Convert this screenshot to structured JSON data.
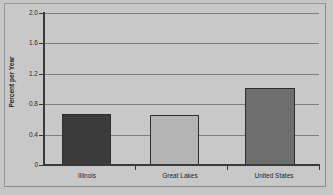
{
  "chart_data": {
    "type": "bar",
    "title": "",
    "xlabel": "",
    "ylabel": "Percent per Year",
    "categories": [
      "Illinois",
      "Great Lakes",
      "United States"
    ],
    "values": [
      0.67,
      0.66,
      1.01
    ],
    "series": [
      {
        "name": "Percent per Year",
        "values": [
          0.67,
          0.66,
          1.01
        ]
      }
    ],
    "bar_colors": [
      "#3b3b3b",
      "#b4b4b4",
      "#6e6e6e"
    ],
    "ylim": [
      0,
      2.0
    ],
    "ytick_labels": [
      "0",
      "0.4",
      "0.8",
      "1.2",
      "1.6",
      "2.0"
    ],
    "ytick_values": [
      0,
      0.4,
      0.8,
      1.2,
      1.6,
      2.0
    ],
    "grid": true,
    "legend": "none",
    "background_color": "#c8c8c8",
    "gridline_color": "#7e7e7e",
    "axis_color": "#3a3a3a"
  }
}
